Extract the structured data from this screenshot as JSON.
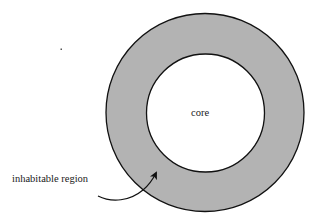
{
  "diagram": {
    "type": "concentric-circles",
    "labels": {
      "core": "core",
      "inhabitable_region": "inhabitable region"
    },
    "colors": {
      "ring_fill": "#b3b3b3",
      "core_fill": "#ffffff",
      "stroke": "#111111",
      "background": "#ffffff"
    },
    "shapes": {
      "outer_circle": {
        "cx": 205,
        "cy": 112.5,
        "r": 99
      },
      "inner_circle": {
        "cx": 205.5,
        "cy": 113,
        "r": 59
      }
    },
    "arrow": {
      "from_label": "inhabitable region",
      "points_to": "ring"
    }
  }
}
